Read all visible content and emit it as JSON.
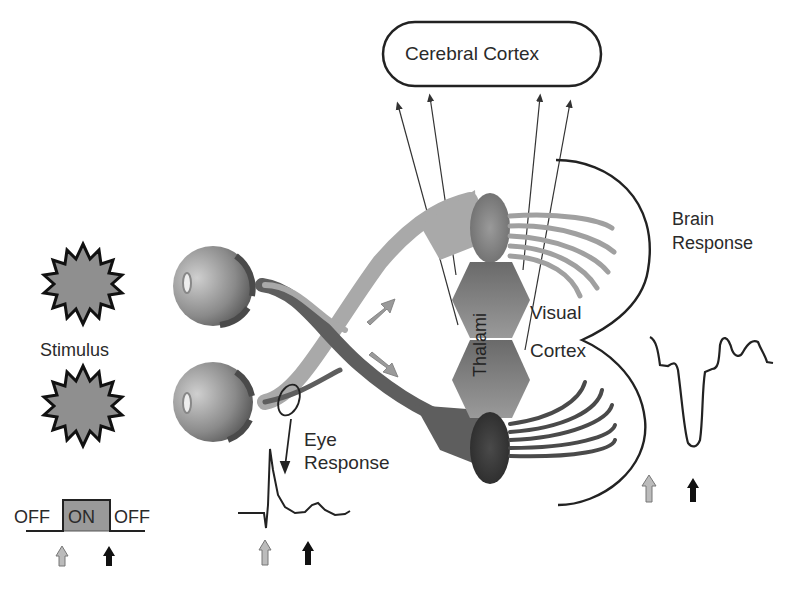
{
  "colors": {
    "background": "#ffffff",
    "stimulus_fill": "#8f8f8f",
    "outline": "#1a1a1a",
    "light_nerve": "#a8a8a8",
    "dark_nerve": "#5a5a5a",
    "thalamus": "#7d7d7d",
    "on_box": "#9a9a9a",
    "gray_arrow": "#a0a0a0",
    "black_arrow": "#1a1a1a"
  },
  "labels": {
    "cerebral_cortex": "Cerebral Cortex",
    "stimulus": "Stimulus",
    "eye_response_line1": "Eye",
    "eye_response_line2": "Response",
    "brain_response_line1": "Brain",
    "brain_response_line2": "Response",
    "visual": "Visual",
    "cortex": "Cortex",
    "thalami": "Thalami"
  },
  "stimulus_timeline": {
    "off_left": "OFF",
    "on": "ON",
    "off_right": "OFF",
    "markers": [
      {
        "name": "onset",
        "color": "gray"
      },
      {
        "name": "offset",
        "color": "black"
      }
    ]
  },
  "icons": {
    "stimulus": "starburst-icon",
    "eye": "eyeball-icon",
    "onset_marker": "up-arrow-gray",
    "offset_marker": "up-arrow-black"
  }
}
